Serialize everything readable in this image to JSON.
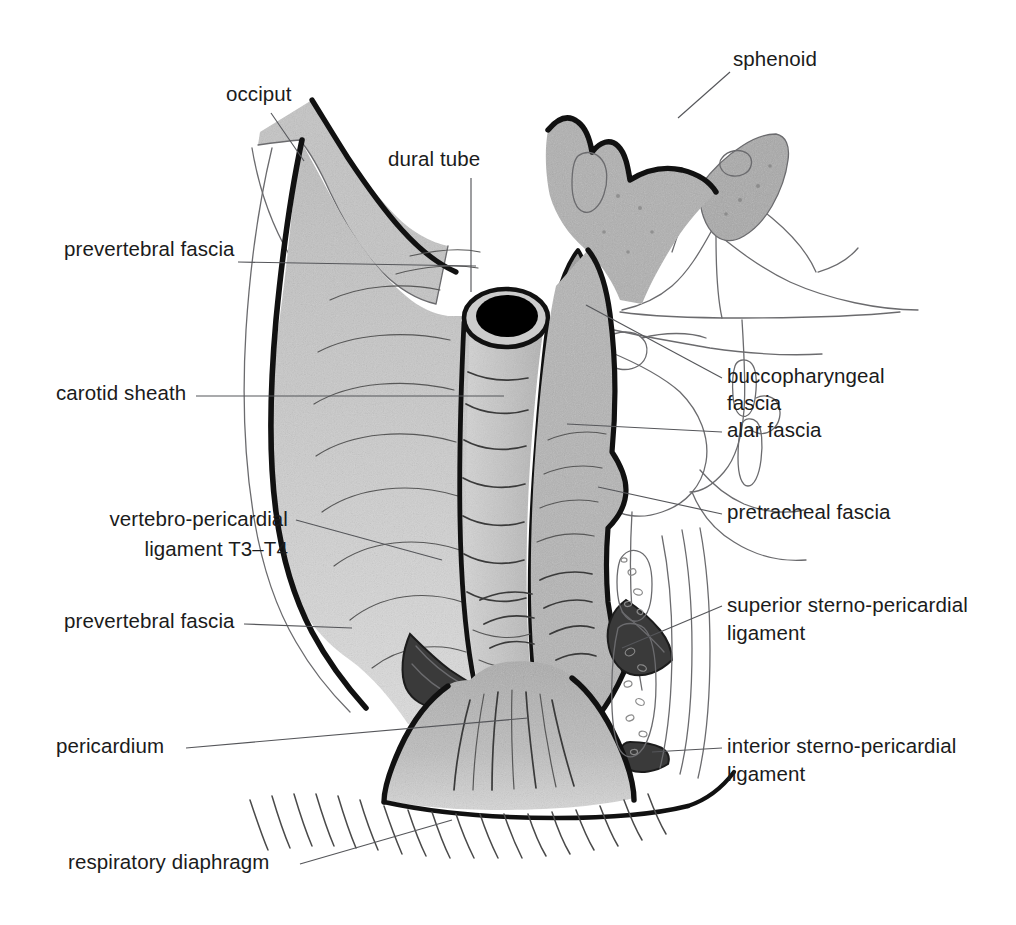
{
  "figure": {
    "background_color": "#ffffff",
    "width": 1016,
    "height": 925
  },
  "palette": {
    "ink": "#111111",
    "text": "#1b1b1b",
    "leader_line": "#55565a",
    "thin_outline": "#6b6b6e",
    "prevertebral_fill": "#c9c9c9",
    "occiput_fill": "#c4c4c4",
    "sphenoid_fill": "#a9a9a9",
    "pharynx_fill": "#b3b3b3",
    "alar_fill": "#9a9a9a",
    "trachea_fill": "#c0c0c0",
    "pericardium_fill": "#b8b8b8",
    "ligament_fill": "#3a3a3a",
    "dural_lumen": "#000000",
    "diaphragm_fill": "#eaeaea"
  },
  "labels": {
    "occiput": {
      "text": "occiput",
      "x": 226,
      "y": 101,
      "anchor": "start"
    },
    "dural_tube": {
      "text": "dural tube",
      "x": 388,
      "y": 166,
      "anchor": "start"
    },
    "sphenoid": {
      "text": "sphenoid",
      "x": 733,
      "y": 66,
      "anchor": "start"
    },
    "prevertebral_fascia_upper": {
      "text": "prevertebral fascia",
      "x": 64,
      "y": 256,
      "anchor": "start"
    },
    "carotid_sheath": {
      "text": "carotid sheath",
      "x": 56,
      "y": 400,
      "anchor": "start"
    },
    "buccopharyngeal_fascia_line1": {
      "text": "buccopharyngeal",
      "x": 727,
      "y": 383,
      "anchor": "start"
    },
    "buccopharyngeal_fascia_line2": {
      "text": "fascia",
      "x": 727,
      "y": 410,
      "anchor": "start"
    },
    "alar_fascia": {
      "text": "alar fascia",
      "x": 727,
      "y": 437,
      "anchor": "start"
    },
    "pretracheal_fascia": {
      "text": "pretracheal fascia",
      "x": 727,
      "y": 519,
      "anchor": "start"
    },
    "vertebro_pericardial_line1": {
      "text": "vertebro-pericardial",
      "x": 288,
      "y": 526,
      "anchor": "end"
    },
    "vertebro_pericardial_line2": {
      "text": "ligament T3–T4",
      "x": 288,
      "y": 556,
      "anchor": "end"
    },
    "prevertebral_fascia_lower": {
      "text": "prevertebral fascia",
      "x": 64,
      "y": 628,
      "anchor": "start"
    },
    "superior_sterno_pericardial_line1": {
      "text": "superior sterno-pericardial",
      "x": 727,
      "y": 612,
      "anchor": "start"
    },
    "superior_sterno_pericardial_line2": {
      "text": "ligament",
      "x": 727,
      "y": 640,
      "anchor": "start"
    },
    "pericardium": {
      "text": "pericardium",
      "x": 56,
      "y": 753,
      "anchor": "start"
    },
    "interior_sterno_pericardial_line1": {
      "text": "interior sterno-pericardial",
      "x": 727,
      "y": 753,
      "anchor": "start"
    },
    "interior_sterno_pericardial_line2": {
      "text": "ligament",
      "x": 727,
      "y": 781,
      "anchor": "start"
    },
    "respiratory_diaphragm": {
      "text": "respiratory diaphragm",
      "x": 68,
      "y": 869,
      "anchor": "start"
    }
  },
  "structures": [
    {
      "name": "occiput",
      "kind": "bone",
      "fill": "#c4c4c4"
    },
    {
      "name": "sphenoid",
      "kind": "bone",
      "fill": "#a9a9a9"
    },
    {
      "name": "dural-tube",
      "kind": "tube",
      "fill": "#c0c0c0",
      "lumen": "#000000"
    },
    {
      "name": "prevertebral-fascia",
      "kind": "fascia-sheet",
      "fill": "#c9c9c9"
    },
    {
      "name": "carotid-sheath",
      "kind": "fascia-sheet",
      "fill": "#c9c9c9"
    },
    {
      "name": "buccopharyngeal-fascia",
      "kind": "fascia-sheet",
      "fill": "#b3b3b3"
    },
    {
      "name": "alar-fascia",
      "kind": "fascia-sheet",
      "fill": "#9a9a9a"
    },
    {
      "name": "pretracheal-fascia",
      "kind": "fascia-sheet",
      "fill": "#b3b3b3"
    },
    {
      "name": "vertebro-pericardial-ligament",
      "kind": "ligament",
      "fill": "#3a3a3a"
    },
    {
      "name": "superior-sterno-pericardial-ligament",
      "kind": "ligament",
      "fill": "#3a3a3a"
    },
    {
      "name": "interior-sterno-pericardial-ligament",
      "kind": "ligament",
      "fill": "#3a3a3a"
    },
    {
      "name": "pericardium",
      "kind": "sac",
      "fill": "#b8b8b8"
    },
    {
      "name": "respiratory-diaphragm",
      "kind": "muscle",
      "fill": "#eaeaea"
    },
    {
      "name": "sternum",
      "kind": "bone",
      "fill": "#ffffff"
    },
    {
      "name": "facial-profile-outline",
      "kind": "outline",
      "fill": "none"
    },
    {
      "name": "tongue-outline",
      "kind": "outline",
      "fill": "none"
    },
    {
      "name": "mandible-outline",
      "kind": "outline",
      "fill": "none"
    }
  ]
}
